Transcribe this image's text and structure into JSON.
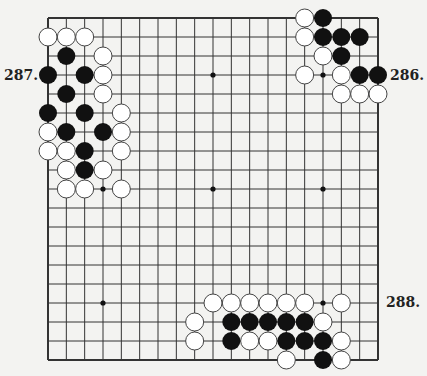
{
  "diagram": {
    "type": "go-board",
    "size": 19,
    "colors": {
      "background": "#f3f3f1",
      "line": "#333333",
      "black": "#111111",
      "white": "#ffffff",
      "white_stroke": "#444444"
    },
    "hoshi": [
      [
        3,
        3
      ],
      [
        9,
        3
      ],
      [
        15,
        3
      ],
      [
        3,
        9
      ],
      [
        9,
        9
      ],
      [
        15,
        9
      ],
      [
        3,
        15
      ],
      [
        9,
        15
      ],
      [
        15,
        15
      ]
    ],
    "stones": {
      "black": [
        [
          1,
          2
        ],
        [
          0,
          3
        ],
        [
          2,
          3
        ],
        [
          1,
          4
        ],
        [
          0,
          5
        ],
        [
          2,
          5
        ],
        [
          1,
          6
        ],
        [
          3,
          6
        ],
        [
          2,
          7
        ],
        [
          2,
          8
        ],
        [
          15,
          0
        ],
        [
          15,
          1
        ],
        [
          16,
          1
        ],
        [
          17,
          1
        ],
        [
          16,
          2
        ],
        [
          17,
          3
        ],
        [
          18,
          3
        ],
        [
          10,
          16
        ],
        [
          11,
          16
        ],
        [
          12,
          16
        ],
        [
          13,
          16
        ],
        [
          14,
          16
        ],
        [
          10,
          17
        ],
        [
          13,
          17
        ],
        [
          14,
          17
        ],
        [
          15,
          17
        ],
        [
          15,
          18
        ]
      ],
      "white": [
        [
          0,
          1
        ],
        [
          1,
          1
        ],
        [
          2,
          1
        ],
        [
          3,
          2
        ],
        [
          3,
          3
        ],
        [
          3,
          4
        ],
        [
          4,
          5
        ],
        [
          0,
          6
        ],
        [
          4,
          6
        ],
        [
          0,
          7
        ],
        [
          1,
          7
        ],
        [
          4,
          7
        ],
        [
          1,
          8
        ],
        [
          3,
          8
        ],
        [
          1,
          9
        ],
        [
          2,
          9
        ],
        [
          4,
          9
        ],
        [
          14,
          0
        ],
        [
          14,
          1
        ],
        [
          15,
          2
        ],
        [
          14,
          3
        ],
        [
          16,
          3
        ],
        [
          16,
          4
        ],
        [
          17,
          4
        ],
        [
          18,
          4
        ],
        [
          9,
          15
        ],
        [
          10,
          15
        ],
        [
          11,
          15
        ],
        [
          12,
          15
        ],
        [
          13,
          15
        ],
        [
          14,
          15
        ],
        [
          16,
          15
        ],
        [
          8,
          16
        ],
        [
          15,
          16
        ],
        [
          8,
          17
        ],
        [
          11,
          17
        ],
        [
          12,
          17
        ],
        [
          16,
          17
        ],
        [
          13,
          18
        ],
        [
          16,
          18
        ]
      ]
    },
    "labels": [
      {
        "text": "287.",
        "x": 4,
        "y": 68
      },
      {
        "text": "286.",
        "x": 390,
        "y": 68
      },
      {
        "text": "288.",
        "x": 386,
        "y": 295
      }
    ]
  }
}
